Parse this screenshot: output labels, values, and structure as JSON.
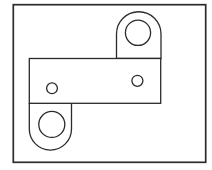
{
  "page": {
    "width": 212,
    "height": 170,
    "background_color": "#ffffff"
  },
  "drawing": {
    "kind": "outline-line-drawing",
    "subject": "flat link plate with two rounded lobes and four holes",
    "stroke_color": "#2b2b2b",
    "fill_color": "#ffffff",
    "shapes": [
      {
        "name": "outer-frame",
        "tag": "rect",
        "stroke_width": 1.7,
        "attrs": {
          "x": 13.3,
          "y": 4.7,
          "width": 192.4,
          "height": 157.6
        }
      },
      {
        "name": "top-lobe",
        "tag": "path",
        "stroke_width": 1.3,
        "attrs": {
          "d": "M 116.5 58.5 L 116.5 34 A 22.25 22.25 0 0 1 161 34 L 161 58.5 Z"
        }
      },
      {
        "name": "bottom-lobe",
        "tag": "path",
        "stroke_width": 1.3,
        "attrs": {
          "d": "M 71.5 103.3 L 71.5 129 A 21.1 21.1 0 0 1 29.3 129 L 29.3 103.3 Z"
        }
      },
      {
        "name": "plate-body",
        "tag": "rect",
        "stroke_width": 1.3,
        "attrs": {
          "x": 29.3,
          "y": 58.5,
          "width": 131.4,
          "height": 44.8
        }
      },
      {
        "name": "top-lobe-hole",
        "tag": "circle",
        "stroke_width": 1.3,
        "attrs": {
          "cx": 138,
          "cy": 32.8,
          "r": 12.6
        }
      },
      {
        "name": "bottom-lobe-hole",
        "tag": "circle",
        "stroke_width": 1.3,
        "attrs": {
          "cx": 51.8,
          "cy": 124.4,
          "r": 13
        }
      },
      {
        "name": "plate-hole-left",
        "tag": "circle",
        "stroke_width": 1.3,
        "attrs": {
          "cx": 52,
          "cy": 88.3,
          "r": 5.4
        }
      },
      {
        "name": "plate-hole-right",
        "tag": "circle",
        "stroke_width": 1.3,
        "attrs": {
          "cx": 137.4,
          "cy": 80.8,
          "r": 5.5
        }
      }
    ]
  }
}
